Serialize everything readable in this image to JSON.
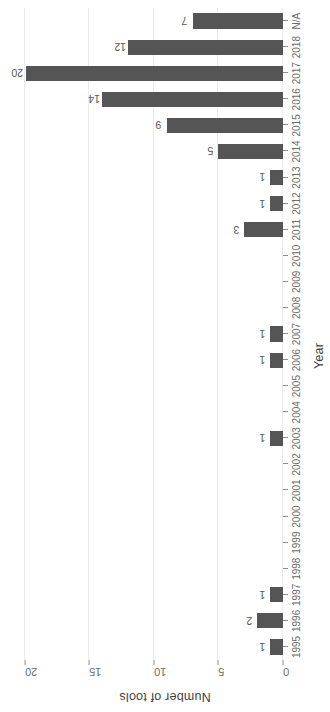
{
  "chart_data": {
    "type": "bar",
    "title": "",
    "xlabel": "Year",
    "ylabel": "Number of tools",
    "categories": [
      "1995",
      "1996",
      "1997",
      "1998",
      "1999",
      "2000",
      "2001",
      "2002",
      "2003",
      "2004",
      "2005",
      "2006",
      "2007",
      "2008",
      "2009",
      "2010",
      "2011",
      "2012",
      "2013",
      "2014",
      "2015",
      "2016",
      "2017",
      "2018",
      "N/A"
    ],
    "values": [
      1,
      2,
      1,
      0,
      0,
      0,
      0,
      0,
      1,
      0,
      0,
      1,
      1,
      0,
      0,
      0,
      3,
      1,
      1,
      5,
      9,
      14,
      20,
      12,
      7
    ],
    "bar_labels": [
      "1",
      "2",
      "1",
      "",
      "",
      "",
      "",
      "",
      "1",
      "",
      "",
      "1",
      "1",
      "",
      "",
      "",
      "3",
      "1",
      "1",
      "5",
      "9",
      "14",
      "20",
      "12",
      "7"
    ],
    "ylim": [
      0,
      21
    ],
    "yticks": [
      0,
      5,
      10,
      15,
      20
    ],
    "ytick_labels": [
      "0",
      "5",
      "10",
      "15",
      "20"
    ],
    "grid": true,
    "grid_axis": "y",
    "legend": null,
    "orientation": "vertical-bars-rotated-90",
    "colors": {
      "bar": "#555555",
      "grid": "#ebebeb",
      "tick_text": "#6b6b6b",
      "axis_title": "#3f3f3f",
      "value_label": "#555555",
      "background": "#ffffff"
    }
  },
  "axes": {
    "x_title": "Year",
    "y_title": "Number of tools"
  }
}
